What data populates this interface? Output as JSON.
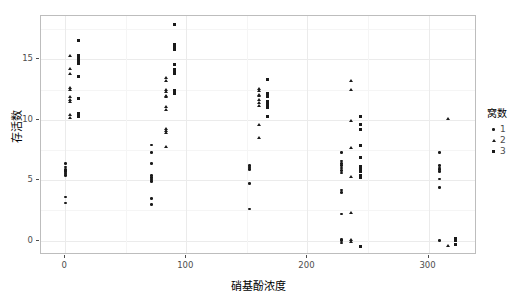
{
  "chart_data": {
    "type": "scatter",
    "title": "",
    "xlabel": "硝基酚浓度",
    "ylabel": "存活数",
    "xlim": [
      -20,
      340
    ],
    "ylim": [
      -1.2,
      18.6
    ],
    "xticks": [
      0,
      100,
      200,
      300
    ],
    "yticks": [
      0,
      5,
      10,
      15
    ],
    "grid": true,
    "legend": {
      "title": "窝数",
      "position": "right",
      "entries": [
        {
          "label": "1",
          "shape": "circle"
        },
        {
          "label": "2",
          "shape": "triangle"
        },
        {
          "label": "3",
          "shape": "square"
        }
      ]
    },
    "series": [
      {
        "name": "1",
        "shape": "circle",
        "points": [
          [
            0,
            6.4
          ],
          [
            0,
            6.1
          ],
          [
            0,
            5.9
          ],
          [
            0,
            5.8
          ],
          [
            0,
            5.7
          ],
          [
            0,
            5.6
          ],
          [
            0,
            5.5
          ],
          [
            0,
            5.4
          ],
          [
            0,
            3.6
          ],
          [
            0,
            3.1
          ],
          [
            71,
            7.9
          ],
          [
            71,
            7.3
          ],
          [
            71,
            6.4
          ],
          [
            71,
            5.4
          ],
          [
            71,
            5.2
          ],
          [
            71,
            5.1
          ],
          [
            71,
            5.0
          ],
          [
            71,
            4.9
          ],
          [
            71,
            3.5
          ],
          [
            71,
            3.0
          ],
          [
            152,
            6.2
          ],
          [
            152,
            6.1
          ],
          [
            152,
            6.0
          ],
          [
            152,
            5.9
          ],
          [
            152,
            4.7
          ],
          [
            152,
            2.6
          ],
          [
            228,
            7.3
          ],
          [
            228,
            6.6
          ],
          [
            228,
            6.4
          ],
          [
            228,
            6.2
          ],
          [
            228,
            6.0
          ],
          [
            228,
            5.8
          ],
          [
            228,
            5.6
          ],
          [
            228,
            4.2
          ],
          [
            228,
            4.0
          ],
          [
            228,
            2.2
          ],
          [
            228,
            0.1
          ],
          [
            228,
            0.0
          ],
          [
            228,
            -0.2
          ],
          [
            309,
            7.3
          ],
          [
            309,
            6.2
          ],
          [
            309,
            6.0
          ],
          [
            309,
            5.9
          ],
          [
            309,
            5.7
          ],
          [
            309,
            5.1
          ],
          [
            309,
            4.4
          ],
          [
            309,
            0.0
          ]
        ]
      },
      {
        "name": "2",
        "shape": "triangle",
        "points": [
          [
            4,
            15.3
          ],
          [
            4,
            14.2
          ],
          [
            4,
            13.8
          ],
          [
            4,
            12.7
          ],
          [
            4,
            12.5
          ],
          [
            4,
            11.9
          ],
          [
            4,
            11.7
          ],
          [
            4,
            11.5
          ],
          [
            4,
            10.4
          ],
          [
            4,
            10.2
          ],
          [
            83,
            13.5
          ],
          [
            83,
            13.2
          ],
          [
            83,
            12.5
          ],
          [
            83,
            12.3
          ],
          [
            83,
            12.0
          ],
          [
            83,
            11.9
          ],
          [
            83,
            11.1
          ],
          [
            83,
            10.8
          ],
          [
            83,
            9.3
          ],
          [
            83,
            9.1
          ],
          [
            83,
            8.9
          ],
          [
            83,
            7.8
          ],
          [
            160,
            12.6
          ],
          [
            160,
            12.4
          ],
          [
            160,
            12.1
          ],
          [
            160,
            12.0
          ],
          [
            160,
            11.7
          ],
          [
            160,
            11.4
          ],
          [
            160,
            11.2
          ],
          [
            160,
            9.6
          ],
          [
            160,
            8.5
          ],
          [
            236,
            13.2
          ],
          [
            236,
            12.5
          ],
          [
            236,
            9.9
          ],
          [
            236,
            7.7
          ],
          [
            236,
            5.3
          ],
          [
            236,
            2.3
          ],
          [
            236,
            0.1
          ],
          [
            236,
            -0.1
          ],
          [
            316,
            10.1
          ],
          [
            316,
            -0.4
          ]
        ]
      },
      {
        "name": "3",
        "shape": "square",
        "points": [
          [
            11,
            16.6
          ],
          [
            11,
            15.3
          ],
          [
            11,
            15.1
          ],
          [
            11,
            15.0
          ],
          [
            11,
            14.9
          ],
          [
            11,
            14.7
          ],
          [
            11,
            13.6
          ],
          [
            11,
            11.8
          ],
          [
            11,
            10.5
          ],
          [
            11,
            10.3
          ],
          [
            90,
            17.9
          ],
          [
            90,
            16.2
          ],
          [
            90,
            16.0
          ],
          [
            90,
            15.8
          ],
          [
            90,
            14.6
          ],
          [
            90,
            14.2
          ],
          [
            90,
            14.0
          ],
          [
            90,
            13.8
          ],
          [
            90,
            12.4
          ],
          [
            90,
            12.2
          ],
          [
            167,
            13.3
          ],
          [
            167,
            12.2
          ],
          [
            167,
            11.9
          ],
          [
            167,
            11.5
          ],
          [
            167,
            11.3
          ],
          [
            167,
            11.0
          ],
          [
            167,
            10.3
          ],
          [
            244,
            10.3
          ],
          [
            244,
            9.6
          ],
          [
            244,
            9.2
          ],
          [
            244,
            7.9
          ],
          [
            244,
            6.9
          ],
          [
            244,
            6.1
          ],
          [
            244,
            5.9
          ],
          [
            244,
            5.7
          ],
          [
            244,
            5.4
          ],
          [
            244,
            5.2
          ],
          [
            244,
            -0.5
          ],
          [
            322,
            0.2
          ],
          [
            322,
            0.0
          ],
          [
            322,
            -0.3
          ]
        ]
      }
    ]
  }
}
